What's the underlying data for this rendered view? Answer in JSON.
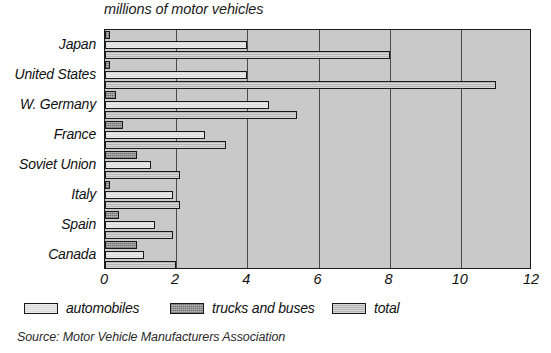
{
  "chart_data": {
    "type": "bar",
    "orientation": "horizontal",
    "title": "millions of motor vehicles",
    "xlabel": "",
    "ylabel": "",
    "xlim": [
      0,
      12
    ],
    "xticks": [
      0,
      2,
      4,
      6,
      8,
      10,
      12
    ],
    "xticklabels": [
      "0",
      "2",
      "4",
      "6",
      "8",
      "10",
      "12"
    ],
    "grid": true,
    "grid_axis": "x",
    "legend_position": "below-axis",
    "categories": [
      "Japan",
      "United States",
      "W. Germany",
      "France",
      "Soviet Union",
      "Italy",
      "Spain",
      "Canada"
    ],
    "series": [
      {
        "name": "trucks and buses",
        "color": "#9b9b9b",
        "values": [
          0.15,
          0.15,
          0.3,
          0.5,
          0.9,
          0.15,
          0.4,
          0.9
        ]
      },
      {
        "name": "automobiles",
        "color": "#d8d8d8",
        "values": [
          4.0,
          4.0,
          4.6,
          2.8,
          1.3,
          1.9,
          1.4,
          1.1
        ]
      },
      {
        "name": "total",
        "color": "#bdbdbd",
        "values": [
          8.0,
          11.0,
          5.4,
          3.4,
          2.1,
          2.1,
          1.9,
          2.0
        ]
      }
    ],
    "legend": [
      {
        "label": "automobiles",
        "swatch": "#d8d8d8"
      },
      {
        "label": "trucks and buses",
        "swatch": "#9b9b9b"
      },
      {
        "label": "total",
        "swatch": "#bdbdbd"
      }
    ],
    "source_note": "Source: Motor Vehicle Manufacturers Association"
  }
}
